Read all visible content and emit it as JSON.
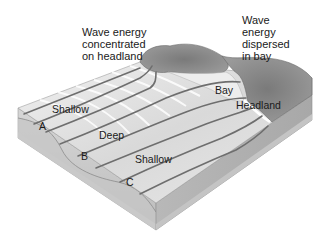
{
  "diagram": {
    "type": "block-diagram",
    "callouts": {
      "headland_energy": "Wave energy\nconcentrated\non headland",
      "bay_energy": "Wave\nenergy\ndispersed\nin bay"
    },
    "labels": {
      "shallow_left": "Shallow",
      "deep": "Deep",
      "shallow_right": "Shallow",
      "bay": "Bay",
      "headland": "Headland",
      "point_a": "A",
      "point_b": "B",
      "point_c": "C"
    },
    "colors": {
      "water_light": "#e6e6e6",
      "water_mid": "#cfcfcf",
      "land": "#8a8a8a",
      "side_face": "#bdbdbd",
      "wave_ray": "#6e6e6e"
    }
  }
}
